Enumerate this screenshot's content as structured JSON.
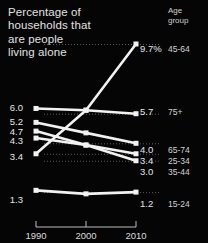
{
  "title": {
    "lines": [
      "Percentage of",
      "households that",
      "are people",
      "living alone"
    ]
  },
  "legend_header": {
    "lines": [
      "Age",
      "group"
    ]
  },
  "colors": {
    "background": "#050505",
    "line": "#f2f2f2",
    "text": "#e6e6e6",
    "grid": "#5a5a5a"
  },
  "chart_data": {
    "type": "line",
    "title": "Percentage of households that are people living alone",
    "xlabel": "",
    "ylabel": "",
    "x": [
      1990,
      2000,
      2010
    ],
    "xtick_labels": [
      "1990",
      "2000",
      "2010"
    ],
    "ylim": [
      0,
      10.2
    ],
    "grid": "dotted-horizontal-right",
    "legend_position": "right",
    "units": "%",
    "series": [
      {
        "name": "45-64",
        "values": [
          3.4,
          5.9,
          9.7
        ],
        "start_label": "3.4",
        "end_label": "9.7%"
      },
      {
        "name": "75+",
        "values": [
          6.0,
          5.9,
          5.7
        ],
        "start_label": "6.0",
        "end_label": "5.7"
      },
      {
        "name": "65-74",
        "values": [
          5.2,
          4.6,
          4.0
        ],
        "start_label": "5.2",
        "end_label": "4.0"
      },
      {
        "name": "25-34",
        "values": [
          4.7,
          3.9,
          3.4
        ],
        "start_label": "4.7",
        "end_label": "3.4"
      },
      {
        "name": "35-44",
        "values": [
          4.3,
          3.9,
          3.0
        ],
        "start_label": "4.3",
        "end_label": "3.0"
      },
      {
        "name": "15-24",
        "values": [
          1.3,
          1.1,
          1.2
        ],
        "start_label": "1.3",
        "end_label": "1.2"
      }
    ]
  },
  "left_labels": [
    {
      "text": "6.0",
      "top": 103
    },
    {
      "text": "5.2",
      "top": 117
    },
    {
      "text": "4.7",
      "top": 127
    },
    {
      "text": "4.3",
      "top": 136
    },
    {
      "text": "3.4",
      "top": 152
    },
    {
      "text": "1.3",
      "top": 195
    }
  ],
  "right_labels": [
    {
      "text": "9.7%",
      "top": 44
    },
    {
      "text": "5.7",
      "top": 107
    },
    {
      "text": "4.0",
      "top": 145
    },
    {
      "text": "3.4",
      "top": 156
    },
    {
      "text": "3.0",
      "top": 167
    },
    {
      "text": "1.2",
      "top": 199
    }
  ],
  "group_labels": [
    {
      "text": "45-64",
      "top": 44
    },
    {
      "text": "75+",
      "top": 107
    },
    {
      "text": "65-74",
      "top": 145
    },
    {
      "text": "25-34",
      "top": 156
    },
    {
      "text": "35-44",
      "top": 167
    },
    {
      "text": "15-24",
      "top": 199
    }
  ],
  "xaxis": {
    "ticks": [
      {
        "label": "1990",
        "left": 36
      },
      {
        "label": "2000",
        "left": 86
      },
      {
        "label": "2010",
        "left": 136
      }
    ]
  }
}
